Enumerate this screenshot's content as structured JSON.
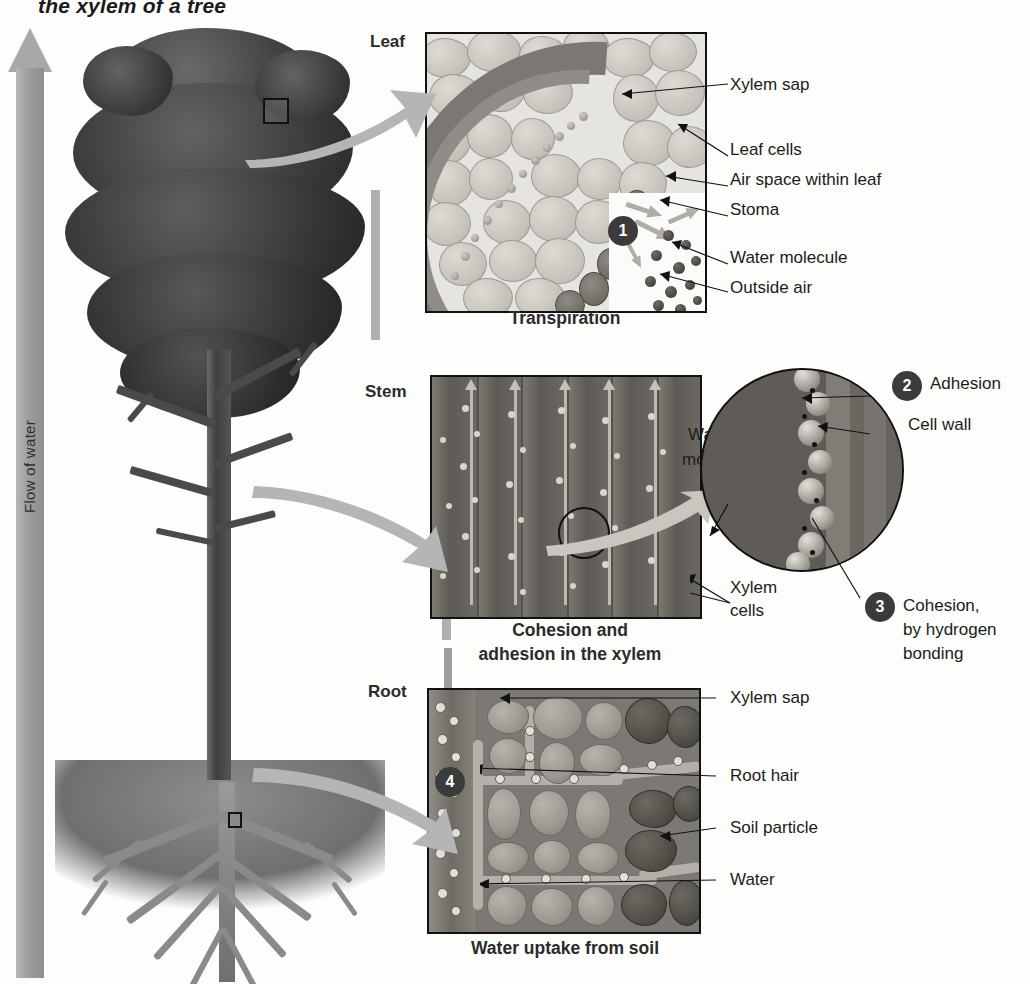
{
  "title": "the xylem of a tree",
  "flow": {
    "label": "Flow of water",
    "direction": "upward"
  },
  "sections": [
    {
      "id": "leaf",
      "label": "Leaf",
      "caption": "Transpiration"
    },
    {
      "id": "stem",
      "label": "Stem",
      "caption": "Cohesion and\nadhesion in the xylem"
    },
    {
      "id": "root",
      "label": "Root",
      "caption": "Water uptake from soil"
    }
  ],
  "captions": {
    "leaf": "Transpiration",
    "stem_line1": "Cohesion and",
    "stem_line2": "adhesion in the xylem",
    "root": "Water uptake from soil"
  },
  "steps": [
    {
      "number": "1",
      "process": "Transpiration",
      "panel": "leaf"
    },
    {
      "number": "2",
      "process": "Adhesion",
      "panel": "stem"
    },
    {
      "number": "3",
      "process": "Cohesion, by hydrogen bonding",
      "panel": "stem"
    },
    {
      "number": "4",
      "process": "Water uptake from soil",
      "panel": "root"
    }
  ],
  "leaf_labels": [
    {
      "text": "Xylem sap"
    },
    {
      "text": "Leaf cells"
    },
    {
      "text": "Air space within leaf"
    },
    {
      "text": "Stoma"
    },
    {
      "text": "Water molecule"
    },
    {
      "text": "Outside air"
    }
  ],
  "stem_labels": [
    {
      "text": "Water",
      "text2": "molecule"
    },
    {
      "text": "Xylem",
      "text2": "cells"
    },
    {
      "text": "Adhesion",
      "number": "2"
    },
    {
      "text": "Cell wall"
    },
    {
      "text": "Cohesion,",
      "text2": "by hydrogen",
      "text3": "bonding",
      "number": "3"
    }
  ],
  "root_labels": [
    {
      "text": "Xylem sap"
    },
    {
      "text": "Root hair"
    },
    {
      "text": "Soil particle"
    },
    {
      "text": "Water"
    }
  ],
  "numbers": {
    "one": "1",
    "two": "2",
    "three": "3",
    "four": "4"
  },
  "colors": {
    "ink": "#1a1a1a",
    "arrow_grey": "#a8a8a8",
    "callout_circle": "#3b3b3b",
    "panel_border": "#111111",
    "page_background": "#fdfdfc"
  }
}
